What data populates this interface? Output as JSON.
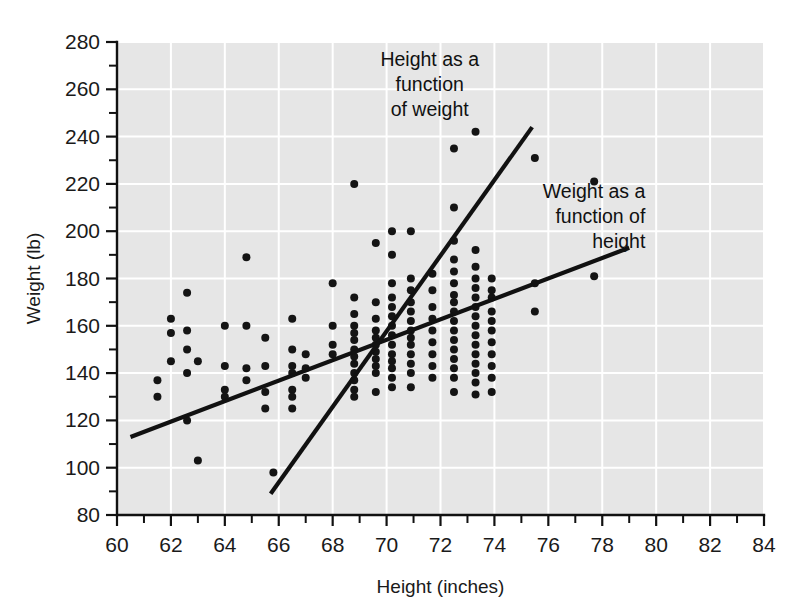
{
  "chart_data": {
    "type": "scatter",
    "title": "",
    "xlabel": "Height (inches)",
    "ylabel": "Weight (lb)",
    "xlim": [
      60,
      84
    ],
    "ylim": [
      80,
      280
    ],
    "x_major_ticks": [
      60,
      62,
      64,
      66,
      68,
      70,
      72,
      74,
      76,
      78,
      80,
      82,
      84
    ],
    "x_minor_step": 1,
    "y_major_ticks": [
      80,
      100,
      120,
      140,
      160,
      180,
      200,
      220,
      240,
      260,
      280
    ],
    "y_minor_step": 10,
    "x_tick_labels": [
      "60",
      "62",
      "64",
      "66",
      "68",
      "70",
      "72",
      "74",
      "76",
      "78",
      "80",
      "82",
      "84"
    ],
    "y_tick_labels": [
      "80",
      "100",
      "120",
      "140",
      "160",
      "180",
      "200",
      "220",
      "240",
      "260",
      "280"
    ],
    "grid": true,
    "grid_color": "#ffffff",
    "plot_background": "#e6e6e6",
    "point_color": "#141414",
    "legend": "none",
    "points": [
      [
        61.5,
        137
      ],
      [
        61.5,
        130
      ],
      [
        62.0,
        163
      ],
      [
        62.0,
        157
      ],
      [
        62.0,
        145
      ],
      [
        62.6,
        174
      ],
      [
        62.6,
        158
      ],
      [
        62.6,
        150
      ],
      [
        62.6,
        140
      ],
      [
        62.6,
        120
      ],
      [
        63.0,
        145
      ],
      [
        63.0,
        103
      ],
      [
        64.0,
        160
      ],
      [
        64.0,
        143
      ],
      [
        64.0,
        133
      ],
      [
        64.0,
        130
      ],
      [
        64.8,
        189
      ],
      [
        64.8,
        160
      ],
      [
        64.8,
        142
      ],
      [
        64.8,
        137
      ],
      [
        65.5,
        155
      ],
      [
        65.5,
        143
      ],
      [
        65.5,
        132
      ],
      [
        65.5,
        125
      ],
      [
        65.8,
        98
      ],
      [
        66.5,
        163
      ],
      [
        66.5,
        150
      ],
      [
        66.5,
        143
      ],
      [
        66.5,
        140
      ],
      [
        66.5,
        133
      ],
      [
        66.5,
        130
      ],
      [
        66.5,
        125
      ],
      [
        67.0,
        148
      ],
      [
        67.0,
        142
      ],
      [
        67.0,
        138
      ],
      [
        68.0,
        178
      ],
      [
        68.0,
        160
      ],
      [
        68.0,
        152
      ],
      [
        68.0,
        148
      ],
      [
        68.8,
        220
      ],
      [
        68.8,
        172
      ],
      [
        68.8,
        165
      ],
      [
        68.8,
        160
      ],
      [
        68.8,
        157
      ],
      [
        68.8,
        154
      ],
      [
        68.8,
        150
      ],
      [
        68.8,
        147
      ],
      [
        68.8,
        144
      ],
      [
        68.8,
        140
      ],
      [
        68.8,
        137
      ],
      [
        68.8,
        133
      ],
      [
        68.8,
        130
      ],
      [
        69.6,
        195
      ],
      [
        69.6,
        170
      ],
      [
        69.6,
        163
      ],
      [
        69.6,
        158
      ],
      [
        69.6,
        155
      ],
      [
        69.6,
        152
      ],
      [
        69.6,
        149
      ],
      [
        69.6,
        146
      ],
      [
        69.6,
        143
      ],
      [
        69.6,
        140
      ],
      [
        69.6,
        132
      ],
      [
        70.2,
        200
      ],
      [
        70.2,
        190
      ],
      [
        70.2,
        178
      ],
      [
        70.2,
        172
      ],
      [
        70.2,
        168
      ],
      [
        70.2,
        164
      ],
      [
        70.2,
        160
      ],
      [
        70.2,
        156
      ],
      [
        70.2,
        152
      ],
      [
        70.2,
        148
      ],
      [
        70.2,
        145
      ],
      [
        70.2,
        142
      ],
      [
        70.2,
        138
      ],
      [
        70.2,
        134
      ],
      [
        70.9,
        200
      ],
      [
        70.9,
        180
      ],
      [
        70.9,
        175
      ],
      [
        70.9,
        170
      ],
      [
        70.9,
        166
      ],
      [
        70.9,
        162
      ],
      [
        70.9,
        158
      ],
      [
        70.9,
        155
      ],
      [
        70.9,
        152
      ],
      [
        70.9,
        148
      ],
      [
        70.9,
        144
      ],
      [
        70.9,
        140
      ],
      [
        70.9,
        134
      ],
      [
        71.7,
        182
      ],
      [
        71.7,
        175
      ],
      [
        71.7,
        168
      ],
      [
        71.7,
        163
      ],
      [
        71.7,
        158
      ],
      [
        71.7,
        153
      ],
      [
        71.7,
        148
      ],
      [
        71.7,
        143
      ],
      [
        71.7,
        138
      ],
      [
        72.5,
        235
      ],
      [
        72.5,
        210
      ],
      [
        72.5,
        196
      ],
      [
        72.5,
        188
      ],
      [
        72.5,
        183
      ],
      [
        72.5,
        178
      ],
      [
        72.5,
        173
      ],
      [
        72.5,
        170
      ],
      [
        72.5,
        166
      ],
      [
        72.5,
        162
      ],
      [
        72.5,
        158
      ],
      [
        72.5,
        154
      ],
      [
        72.5,
        150
      ],
      [
        72.5,
        146
      ],
      [
        72.5,
        142
      ],
      [
        72.5,
        138
      ],
      [
        72.5,
        132
      ],
      [
        73.3,
        242
      ],
      [
        73.3,
        192
      ],
      [
        73.3,
        185
      ],
      [
        73.3,
        180
      ],
      [
        73.3,
        176
      ],
      [
        73.3,
        172
      ],
      [
        73.3,
        168
      ],
      [
        73.3,
        164
      ],
      [
        73.3,
        160
      ],
      [
        73.3,
        156
      ],
      [
        73.3,
        152
      ],
      [
        73.3,
        148
      ],
      [
        73.3,
        144
      ],
      [
        73.3,
        140
      ],
      [
        73.3,
        136
      ],
      [
        73.3,
        131
      ],
      [
        73.9,
        180
      ],
      [
        73.9,
        175
      ],
      [
        73.9,
        172
      ],
      [
        73.9,
        166
      ],
      [
        73.9,
        162
      ],
      [
        73.9,
        158
      ],
      [
        73.9,
        153
      ],
      [
        73.9,
        148
      ],
      [
        73.9,
        143
      ],
      [
        73.9,
        138
      ],
      [
        73.9,
        132
      ],
      [
        75.5,
        231
      ],
      [
        75.5,
        178
      ],
      [
        75.5,
        166
      ],
      [
        77.7,
        221
      ],
      [
        77.7,
        181
      ]
    ],
    "fit_lines": [
      {
        "name": "Weight as a function of height",
        "label_lines": [
          "Weight as a",
          "function of",
          "height"
        ],
        "x1": 60.5,
        "y1": 113,
        "x2": 79.0,
        "y2": 193,
        "label_anchor": "end",
        "label_x": 79.6,
        "label_y": 214
      },
      {
        "name": "Height as a function of weight",
        "label_lines": [
          "Height as a",
          "function",
          "of weight"
        ],
        "x1": 65.7,
        "y1": 89,
        "x2": 75.4,
        "y2": 244,
        "label_anchor": "middle",
        "label_x": 71.6,
        "label_y": 270
      }
    ]
  }
}
